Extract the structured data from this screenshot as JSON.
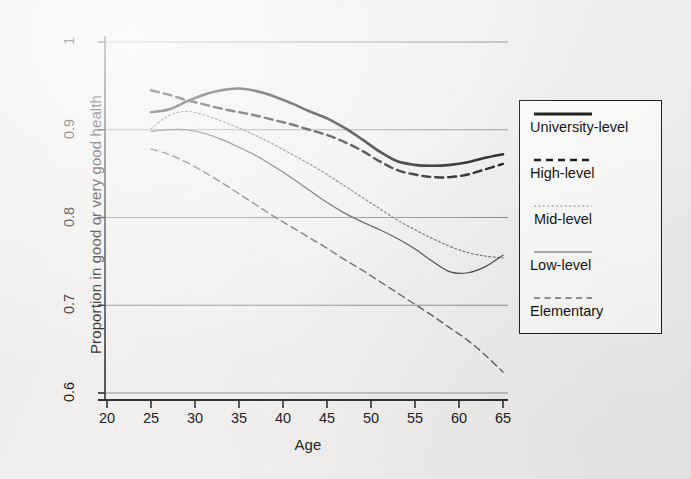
{
  "chart_data": {
    "type": "line",
    "title": "",
    "xlabel": "Age",
    "ylabel": "Proportion in good or very good health",
    "xlim": [
      20,
      66
    ],
    "ylim": [
      0.575,
      1.015
    ],
    "xticks": [
      20,
      25,
      30,
      35,
      40,
      45,
      50,
      55,
      60,
      65
    ],
    "yticks": [
      0.6,
      0.7,
      0.8,
      0.9,
      1
    ],
    "ytick_labels": [
      "0.6",
      "0.7",
      "0.8",
      "0.9",
      "1"
    ],
    "xtick_labels": [
      "20",
      "25",
      "30",
      "35",
      "40",
      "45",
      "50",
      "55",
      "60",
      "65"
    ],
    "grid": "horizontal",
    "legend_position": "right",
    "x": [
      25,
      27,
      29,
      31,
      33,
      35,
      37,
      39,
      41,
      43,
      45,
      47,
      49,
      51,
      53,
      55,
      57,
      59,
      61,
      63,
      65
    ],
    "series": [
      {
        "name": "University-level",
        "style": "solid",
        "width": 2.6,
        "color": "#1a1a1a",
        "values": [
          0.92,
          0.923,
          0.932,
          0.94,
          0.945,
          0.947,
          0.944,
          0.938,
          0.93,
          0.921,
          0.913,
          0.902,
          0.889,
          0.875,
          0.864,
          0.86,
          0.859,
          0.86,
          0.863,
          0.868,
          0.872
        ]
      },
      {
        "name": "High-level",
        "style": "dashed",
        "width": 2.4,
        "color": "#1a1a1a",
        "values": [
          0.945,
          0.94,
          0.934,
          0.929,
          0.924,
          0.92,
          0.916,
          0.911,
          0.906,
          0.9,
          0.894,
          0.886,
          0.876,
          0.864,
          0.854,
          0.849,
          0.846,
          0.846,
          0.849,
          0.855,
          0.861
        ]
      },
      {
        "name": "Mid-level",
        "style": "dotted",
        "width": 1.2,
        "color": "#6e6e6e",
        "values": [
          0.901,
          0.916,
          0.921,
          0.917,
          0.91,
          0.902,
          0.893,
          0.883,
          0.872,
          0.861,
          0.849,
          0.836,
          0.823,
          0.81,
          0.797,
          0.786,
          0.776,
          0.767,
          0.76,
          0.756,
          0.754
        ]
      },
      {
        "name": "Low-level",
        "style": "solid",
        "width": 1.2,
        "color": "#4a4a4a",
        "values": [
          0.898,
          0.9,
          0.9,
          0.896,
          0.889,
          0.88,
          0.87,
          0.858,
          0.845,
          0.831,
          0.817,
          0.805,
          0.795,
          0.786,
          0.776,
          0.764,
          0.75,
          0.738,
          0.737,
          0.744,
          0.757
        ]
      },
      {
        "name": "Elementary",
        "style": "dashed",
        "width": 1.4,
        "color": "#5c5c5c",
        "values": [
          0.878,
          0.872,
          0.863,
          0.852,
          0.84,
          0.827,
          0.814,
          0.801,
          0.789,
          0.777,
          0.765,
          0.752,
          0.74,
          0.727,
          0.714,
          0.701,
          0.688,
          0.674,
          0.66,
          0.643,
          0.624
        ]
      }
    ]
  },
  "axes": {
    "ylabel": "Proportion in good or very good health",
    "xlabel": "Age",
    "yticks": [
      "1",
      "0.9",
      "0.8",
      "0.7",
      "0.6"
    ],
    "xticks": [
      "20",
      "25",
      "30",
      "35",
      "40",
      "45",
      "50",
      "55",
      "60",
      "65"
    ]
  },
  "legend": {
    "items": [
      {
        "label": "University-level",
        "style": "solid-thick"
      },
      {
        "label": "High-level",
        "style": "dashed-thick"
      },
      {
        "label": "Mid-level",
        "style": "dotted-thin"
      },
      {
        "label": "Low-level",
        "style": "solid-thin"
      },
      {
        "label": "Elementary",
        "style": "dashed-thin"
      }
    ]
  }
}
